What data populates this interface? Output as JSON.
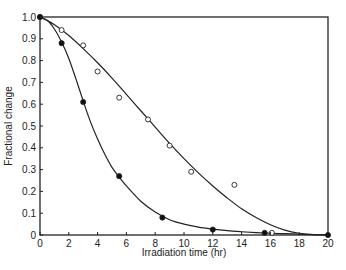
{
  "chart_data": {
    "type": "line",
    "title": "",
    "xlabel": "Irradiation time (hr)",
    "ylabel": "Fractional change",
    "xlim": [
      0,
      20
    ],
    "ylim": [
      0,
      1.0
    ],
    "x_ticks": [
      0,
      2,
      4,
      6,
      8,
      10,
      12,
      14,
      16,
      18,
      20
    ],
    "y_ticks": [
      0,
      0.1,
      0.2,
      0.3,
      0.4,
      0.5,
      0.6,
      0.7,
      0.8,
      0.9,
      1.0
    ],
    "y_tick_labels": [
      "0",
      "0.1",
      "0.2",
      "0.3",
      "0.4",
      "0.5",
      "0.6",
      "0.7",
      "0.8",
      "0.9",
      "1.0"
    ],
    "grid": false,
    "legend": null,
    "series": [
      {
        "name": "open circles",
        "marker": "open-circle",
        "points": [
          [
            0,
            1.0
          ],
          [
            1.5,
            0.94
          ],
          [
            3,
            0.87
          ],
          [
            4,
            0.75
          ],
          [
            5.5,
            0.63
          ],
          [
            7.5,
            0.53
          ],
          [
            9,
            0.41
          ],
          [
            10.5,
            0.29
          ],
          [
            13.5,
            0.23
          ],
          [
            16.1,
            0.01
          ]
        ],
        "curve": [
          [
            0,
            1.0
          ],
          [
            1,
            0.965
          ],
          [
            2,
            0.915
          ],
          [
            3,
            0.855
          ],
          [
            4,
            0.79
          ],
          [
            5,
            0.72
          ],
          [
            6,
            0.645
          ],
          [
            7,
            0.57
          ],
          [
            8,
            0.495
          ],
          [
            9,
            0.42
          ],
          [
            10,
            0.35
          ],
          [
            11,
            0.285
          ],
          [
            12,
            0.225
          ],
          [
            13,
            0.17
          ],
          [
            14,
            0.12
          ],
          [
            15,
            0.08
          ],
          [
            16,
            0.047
          ],
          [
            17,
            0.022
          ],
          [
            18,
            0.008
          ],
          [
            19,
            0.002
          ],
          [
            20,
            0.0
          ]
        ]
      },
      {
        "name": "filled circles",
        "marker": "filled-circle",
        "points": [
          [
            0,
            1.0
          ],
          [
            1.5,
            0.88
          ],
          [
            3,
            0.61
          ],
          [
            5.5,
            0.27
          ],
          [
            8.5,
            0.08
          ],
          [
            12,
            0.025
          ],
          [
            15.6,
            0.01
          ],
          [
            20,
            0.0
          ]
        ],
        "curve": [
          [
            0,
            1.0
          ],
          [
            0.5,
            0.985
          ],
          [
            1,
            0.945
          ],
          [
            1.5,
            0.885
          ],
          [
            2,
            0.81
          ],
          [
            2.5,
            0.715
          ],
          [
            3,
            0.615
          ],
          [
            3.5,
            0.52
          ],
          [
            4,
            0.44
          ],
          [
            4.5,
            0.37
          ],
          [
            5,
            0.31
          ],
          [
            5.5,
            0.265
          ],
          [
            6,
            0.225
          ],
          [
            7,
            0.155
          ],
          [
            8,
            0.105
          ],
          [
            9,
            0.07
          ],
          [
            10,
            0.05
          ],
          [
            11,
            0.036
          ],
          [
            12,
            0.027
          ],
          [
            13,
            0.02
          ],
          [
            14,
            0.015
          ],
          [
            15,
            0.011
          ],
          [
            16,
            0.008
          ],
          [
            17,
            0.006
          ],
          [
            18,
            0.004
          ],
          [
            19,
            0.002
          ],
          [
            20,
            0.0
          ]
        ]
      }
    ]
  }
}
